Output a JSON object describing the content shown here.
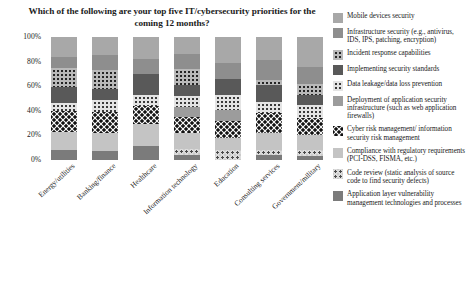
{
  "chart_data": {
    "type": "bar",
    "title": "Which of the following are your top five IT/cybersecurity priorities for the coming 12 months?",
    "xlabel": "",
    "ylabel": "",
    "ylim": [
      0,
      100
    ],
    "ytick_labels": [
      "100%",
      "80%",
      "60%",
      "40%",
      "20%",
      "0%"
    ],
    "ytick_values": [
      100,
      80,
      60,
      40,
      20,
      0
    ],
    "grid": false,
    "stacked": true,
    "normalized_percent": true,
    "legend_position": "right",
    "categories": [
      "Energy/utilities",
      "Banking/finance",
      "Healthcare",
      "Information technology",
      "Education",
      "Consulting services",
      "Government/military"
    ],
    "series": [
      {
        "name": "Mobile devices security",
        "pattern": "solid-light-gray",
        "color": "#a8a8a8",
        "values": [
          16,
          15,
          18,
          14,
          21,
          19,
          24
        ]
      },
      {
        "name": "Infrastructure security (e.g., antivirus, IDS, IPS, patching, encryption)",
        "pattern": "solid-medium-gray",
        "color": "#8e8e8e",
        "values": [
          9,
          12,
          12,
          12,
          13,
          16,
          14
        ]
      },
      {
        "name": "Incident response capabilities",
        "pattern": "dots-dark-on-gray",
        "color": "#b9b9b9",
        "values": [
          16,
          15,
          0,
          13,
          0,
          4,
          9
        ]
      },
      {
        "name": "Implementing security standards",
        "pattern": "solid-dark-gray",
        "color": "#595959",
        "values": [
          13,
          9,
          17,
          9,
          13,
          14,
          8
        ]
      },
      {
        "name": "Data leakage/data loss prevention",
        "pattern": "fine-dots-on-white",
        "color": "#e4e4e4",
        "values": [
          6,
          10,
          9,
          9,
          12,
          9,
          11
        ]
      },
      {
        "name": "Deployment of application security infrastructure (such as web application firewalls)",
        "pattern": "solid-gray",
        "color": "#9c9c9c",
        "values": [
          0,
          0,
          0,
          8,
          9,
          0,
          0
        ]
      },
      {
        "name": "Cyber risk management/ information security risk management",
        "pattern": "checker-dots-black",
        "color": "#f2f2f2",
        "values": [
          17,
          17,
          15,
          13,
          14,
          16,
          14
        ]
      },
      {
        "name": "Compliance with regulatory requirements (PCI-DSS, FISMA, etc.)",
        "pattern": "solid-light",
        "color": "#c4c4c4",
        "values": [
          15,
          15,
          18,
          13,
          10,
          14,
          12
        ]
      },
      {
        "name": "Code review (static analysis of source code to find security defects)",
        "pattern": "speckle",
        "color": "#dcdcdc",
        "values": [
          0,
          0,
          0,
          5,
          8,
          4,
          5
        ]
      },
      {
        "name": "Application layer vulnerability management technologies and processes",
        "pattern": "solid-dark",
        "color": "#7b7b7b",
        "values": [
          8,
          7,
          11,
          4,
          0,
          4,
          3
        ]
      }
    ]
  },
  "legend": {
    "items": [
      {
        "label": "Mobile devices security"
      },
      {
        "label": "Infrastructure security (e.g., antivirus, IDS, IPS, patching, encryption)"
      },
      {
        "label": "Incident response capabilities"
      },
      {
        "label": "Implementing security standards"
      },
      {
        "label": "Data leakage/data loss prevention"
      },
      {
        "label": "Deployment of application security infrastructure (such as web application firewalls)"
      },
      {
        "label": "Cyber risk management/ information security risk management"
      },
      {
        "label": "Compliance with regulatory requirements (PCI-DSS, FISMA, etc.)"
      },
      {
        "label": "Code review (static analysis of source code to find security defects)"
      },
      {
        "label": "Application layer vulnerability management technologies and processes"
      }
    ]
  }
}
